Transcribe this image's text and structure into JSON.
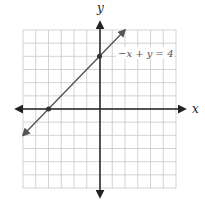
{
  "chart_data": {
    "type": "line",
    "title": "",
    "xlabel": "x",
    "ylabel": "y",
    "grid": true,
    "xlim": [
      -6,
      6
    ],
    "ylim": [
      -6,
      6
    ],
    "series": [
      {
        "name": "-x + y = 4",
        "equation": "-x + y = 4",
        "x": [
          -6,
          2
        ],
        "y": [
          -2,
          6
        ],
        "marked_points": [
          [
            -4,
            0
          ],
          [
            0,
            4
          ]
        ]
      }
    ],
    "annotations": [
      {
        "text": "-x + y = 4",
        "x": 1,
        "y": 4
      }
    ]
  },
  "labels": {
    "x_axis": "x",
    "y_axis": "y",
    "equation": "−x + y = 4"
  },
  "colors": {
    "grid": "#c8c8c8",
    "axis": "#222222",
    "line": "#555555",
    "point": "#333333"
  }
}
